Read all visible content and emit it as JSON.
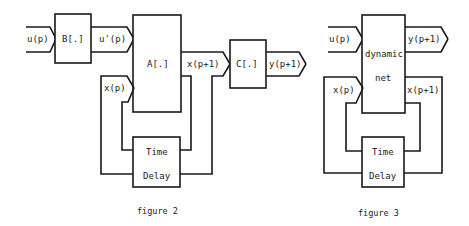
{
  "figure2": {
    "caption": "figure 2",
    "blocks": {
      "B": "B[.]",
      "A": "A[.]",
      "C": "C[.]",
      "delay_line1": "Time",
      "delay_line2": "Delay"
    },
    "signals": {
      "input": "u(p)",
      "transformed_input": "u'(p)",
      "state": "x(p)",
      "next_state": "x(p+1)",
      "output": "y(p+1)"
    }
  },
  "figure3": {
    "caption": "figure 3",
    "blocks": {
      "net_line1": "dynamic",
      "net_line2": "net",
      "delay_line1": "Time",
      "delay_line2": "Delay"
    },
    "signals": {
      "input": "u(p)",
      "output": "y(p+1)",
      "state": "x(p)",
      "next_state": "x(p+1)"
    }
  },
  "colors": {
    "ink": "#1a1a1a",
    "background": "#ffffff"
  }
}
